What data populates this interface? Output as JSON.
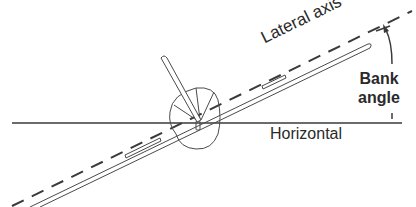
{
  "diagram": {
    "labels": {
      "lateral_axis": "Lateral axis",
      "horizontal": "Horizontal",
      "bank_line1": "Bank",
      "bank_line2": "angle"
    },
    "elements": {
      "horizontal_line": {
        "x1": 12,
        "y1": 123,
        "x2": 402,
        "y2": 123
      },
      "lateral_axis_line": {
        "x1": 12,
        "y1": 207,
        "x2": 410,
        "y2": 12,
        "style": "dashed"
      },
      "aircraft_center": {
        "x": 198,
        "y": 122
      },
      "bank_angle_arc": {
        "from": "horizontal",
        "to": "lateral axis",
        "arrowhead": "at lateral axis"
      }
    },
    "colors": {
      "line": "#3a3a3a",
      "text": "#2a2a2a",
      "background": "#ffffff"
    }
  }
}
